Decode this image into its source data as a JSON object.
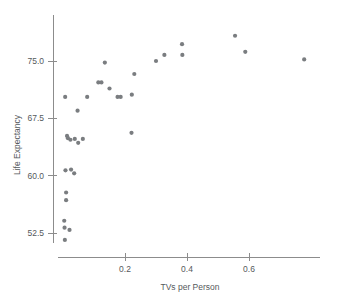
{
  "chart_data": {
    "type": "scatter",
    "title": "",
    "xlabel": "TVs per Person",
    "ylabel": "Life Expectancy",
    "xlim": [
      -0.005,
      0.83
    ],
    "ylim": [
      50.5,
      79.5
    ],
    "xticks": [
      0.2,
      0.4,
      0.6
    ],
    "xtick_labels": [
      "0.2",
      "0.4",
      "0.6"
    ],
    "yticks": [
      52.5,
      60.0,
      67.5,
      75.0
    ],
    "ytick_labels": [
      "52.5",
      "60.0",
      "67.5",
      "75.0"
    ],
    "grid": false,
    "legend": null,
    "marker_color": "#7a7d80",
    "axis_color": "#8c8c8c",
    "text_color": "#55595c",
    "points": [
      {
        "x": 0.006,
        "y": 51.6
      },
      {
        "x": 0.005,
        "y": 53.2
      },
      {
        "x": 0.004,
        "y": 54.1
      },
      {
        "x": 0.021,
        "y": 52.9
      },
      {
        "x": 0.01,
        "y": 56.8
      },
      {
        "x": 0.01,
        "y": 57.8
      },
      {
        "x": 0.008,
        "y": 60.7
      },
      {
        "x": 0.026,
        "y": 60.8
      },
      {
        "x": 0.036,
        "y": 60.3
      },
      {
        "x": 0.013,
        "y": 65.2
      },
      {
        "x": 0.016,
        "y": 64.9
      },
      {
        "x": 0.024,
        "y": 64.7
      },
      {
        "x": 0.038,
        "y": 64.8
      },
      {
        "x": 0.049,
        "y": 64.3
      },
      {
        "x": 0.064,
        "y": 64.8
      },
      {
        "x": 0.007,
        "y": 70.3
      },
      {
        "x": 0.047,
        "y": 68.5
      },
      {
        "x": 0.078,
        "y": 70.3
      },
      {
        "x": 0.114,
        "y": 72.2
      },
      {
        "x": 0.124,
        "y": 72.2
      },
      {
        "x": 0.135,
        "y": 74.8
      },
      {
        "x": 0.15,
        "y": 71.4
      },
      {
        "x": 0.176,
        "y": 70.3
      },
      {
        "x": 0.186,
        "y": 70.3
      },
      {
        "x": 0.222,
        "y": 70.6
      },
      {
        "x": 0.23,
        "y": 73.3
      },
      {
        "x": 0.221,
        "y": 65.6
      },
      {
        "x": 0.3,
        "y": 75.0
      },
      {
        "x": 0.327,
        "y": 75.8
      },
      {
        "x": 0.384,
        "y": 77.2
      },
      {
        "x": 0.385,
        "y": 75.8
      },
      {
        "x": 0.555,
        "y": 78.3
      },
      {
        "x": 0.588,
        "y": 76.2
      },
      {
        "x": 0.778,
        "y": 75.2
      }
    ]
  }
}
